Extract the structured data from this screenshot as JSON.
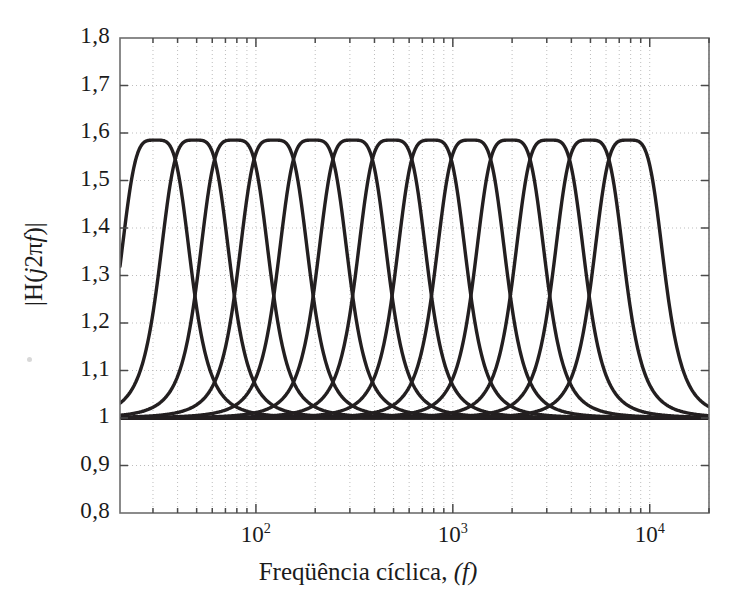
{
  "figure": {
    "background_color": "#ffffff",
    "axes_color": "#4a4a4a",
    "curve_color": "#231f20",
    "grid_color": "#b9b9b9"
  },
  "axis": {
    "x_title_prefix": "Freqüência cíclica,",
    "x_title_var": "(f)",
    "y_title_open": "|H(",
    "y_title_var": "j",
    "y_title_mid": "2π",
    "y_title_var2": "f",
    "y_title_close": ")|",
    "x_scale": "log",
    "y_scale": "linear",
    "x_ticks": [
      {
        "value": 100,
        "mantissa": "10",
        "exponent": "2"
      },
      {
        "value": 1000,
        "mantissa": "10",
        "exponent": "3"
      },
      {
        "value": 10000,
        "mantissa": "10",
        "exponent": "4"
      }
    ],
    "y_ticks": [
      {
        "value": 1.8,
        "label": "1,8"
      },
      {
        "value": 1.7,
        "label": "1,7"
      },
      {
        "value": 1.6,
        "label": "1,6"
      },
      {
        "value": 1.5,
        "label": "1,5"
      },
      {
        "value": 1.4,
        "label": "1,4"
      },
      {
        "value": 1.3,
        "label": "1,3"
      },
      {
        "value": 1.2,
        "label": "1,2"
      },
      {
        "value": 1.1,
        "label": "1,1"
      },
      {
        "value": 1.0,
        "label": "1"
      },
      {
        "value": 0.9,
        "label": "0,9"
      },
      {
        "value": 0.8,
        "label": "0,8"
      }
    ]
  },
  "chart_data": {
    "type": "line",
    "title": "",
    "xlabel": "Freqüência cíclica, (f)",
    "ylabel": "|H(j2πf)|",
    "xscale": "log",
    "xlim": [
      20.4,
      20000
    ],
    "ylim": [
      0.8,
      1.8
    ],
    "grid": true,
    "grid_style": "dotted",
    "legend": "none",
    "xtick_labels": [
      "10^2",
      "10^3",
      "10^4"
    ],
    "ytick_labels": [
      "0,8",
      "0,9",
      "1",
      "1,1",
      "1,2",
      "1,3",
      "1,4",
      "1,5",
      "1,6",
      "1,7",
      "1,8"
    ],
    "peak_value": 1.585,
    "asymptote_value": 1.0,
    "crossover_value": 1.5,
    "curve_count": 13,
    "center_frequencies": [
      30.9,
      49.0,
      77.7,
      123.2,
      195.4,
      309.8,
      491.3,
      779.0,
      1235.3,
      1958.7,
      3105.8,
      4924.4,
      7808.7
    ],
    "frequency_ratio_between_curves": 1.5849,
    "series": [
      {
        "name": "band-1",
        "center_frequency": 30.9,
        "peak": 1.585
      },
      {
        "name": "band-2",
        "center_frequency": 49.0,
        "peak": 1.585
      },
      {
        "name": "band-3",
        "center_frequency": 77.7,
        "peak": 1.585
      },
      {
        "name": "band-4",
        "center_frequency": 123.2,
        "peak": 1.585
      },
      {
        "name": "band-5",
        "center_frequency": 195.4,
        "peak": 1.585
      },
      {
        "name": "band-6",
        "center_frequency": 309.8,
        "peak": 1.585
      },
      {
        "name": "band-7",
        "center_frequency": 491.3,
        "peak": 1.585
      },
      {
        "name": "band-8",
        "center_frequency": 779.0,
        "peak": 1.585
      },
      {
        "name": "band-9",
        "center_frequency": 1235.3,
        "peak": 1.585
      },
      {
        "name": "band-10",
        "center_frequency": 1958.7,
        "peak": 1.585
      },
      {
        "name": "band-11",
        "center_frequency": 3105.8,
        "peak": 1.585
      },
      {
        "name": "band-12",
        "center_frequency": 4924.4,
        "peak": 1.585
      },
      {
        "name": "band-13",
        "center_frequency": 7808.7,
        "peak": 1.585
      }
    ]
  }
}
